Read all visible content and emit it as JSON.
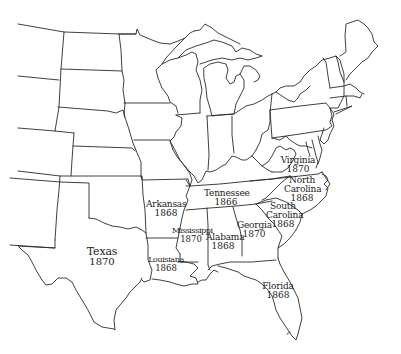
{
  "map": {
    "title": "",
    "background": "#ffffff",
    "line_color": "#2a2a2a",
    "labeled_states": [
      {
        "name": "Texas",
        "year": "1870"
      },
      {
        "name": "Arkansas",
        "year": "1868"
      },
      {
        "name": "Louisiana",
        "year": "1868"
      },
      {
        "name": "Mississippi",
        "year": "1870"
      },
      {
        "name": "Alabama",
        "year": "1868"
      },
      {
        "name": "Tennessee",
        "year": "1866"
      },
      {
        "name": "Georgia",
        "year": "1870"
      },
      {
        "name": "Florida",
        "year": "1868"
      },
      {
        "name": "South Carolina",
        "name_line1": "South",
        "name_line2": "Carolina",
        "year": "1868"
      },
      {
        "name": "North Carolina",
        "name_line1": "North",
        "name_line2": "Carolina",
        "year": "1868"
      },
      {
        "name": "Virginia",
        "year": "1870"
      }
    ]
  }
}
